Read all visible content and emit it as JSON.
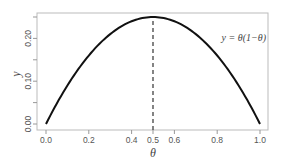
{
  "chart_data": {
    "type": "line",
    "title": "",
    "xlabel": "θ",
    "ylabel": "y",
    "xlim": [
      0,
      1
    ],
    "ylim": [
      0,
      0.25
    ],
    "x_ticks": [
      "0.0",
      "0.2",
      "0.4",
      "0.5",
      "0.6",
      "0.8",
      "1.0"
    ],
    "x_tick_values": [
      0.0,
      0.2,
      0.4,
      0.5,
      0.6,
      0.8,
      1.0
    ],
    "y_ticks": [
      "0.00",
      "0.10",
      "0.20"
    ],
    "y_tick_values": [
      0.0,
      0.1,
      0.2
    ],
    "y_minor_tick_values": [
      0.05,
      0.15,
      0.25
    ],
    "grid": false,
    "series": [
      {
        "name": "y = θ(1−θ)",
        "x": [
          0.0,
          0.1,
          0.2,
          0.3,
          0.4,
          0.5,
          0.6,
          0.7,
          0.8,
          0.9,
          1.0
        ],
        "values": [
          0.0,
          0.09,
          0.16,
          0.21,
          0.24,
          0.25,
          0.24,
          0.21,
          0.16,
          0.09,
          0.0
        ]
      }
    ],
    "annotations": [
      {
        "text": "y = θ(1−θ)",
        "position": "upper right"
      },
      {
        "type": "vertical-dashed-line",
        "x": 0.5,
        "from_y": 0,
        "to_y": 0.25
      }
    ]
  },
  "labels": {
    "xlabel": "θ",
    "ylabel": "y",
    "annotation": "y = θ(1−θ)",
    "xticks": [
      "0.0",
      "0.2",
      "0.4",
      "0.5",
      "0.6",
      "0.8",
      "1.0"
    ],
    "yticks": [
      "0.00",
      "0.10",
      "0.20"
    ]
  },
  "colors": {
    "curve": "#111111",
    "frame": "#bbbbbb",
    "dashed": "#333333",
    "text": "#555555"
  }
}
